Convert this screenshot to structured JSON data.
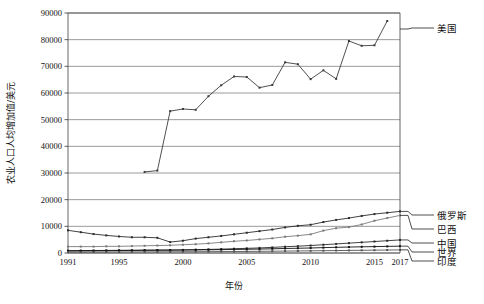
{
  "chart_data": {
    "type": "line",
    "title": "",
    "xlabel": "年份",
    "ylabel": "农业人口人均增加值/美元",
    "xlim": [
      1991,
      2017
    ],
    "ylim": [
      0,
      90000
    ],
    "ytick_labels": [
      "0",
      "10000",
      "20000",
      "30000",
      "40000",
      "50000",
      "60000",
      "70000",
      "80000",
      "90000"
    ],
    "ytick_values": [
      0,
      10000,
      20000,
      30000,
      40000,
      50000,
      60000,
      70000,
      80000,
      90000
    ],
    "xtick_labels": [
      "1991",
      "1995",
      "2000",
      "2005",
      "2010",
      "2015",
      "2017"
    ],
    "xtick_values": [
      1991,
      1995,
      2000,
      2005,
      2010,
      2015,
      2017
    ],
    "grid": true,
    "legend_position": "right",
    "x": [
      1991,
      1992,
      1993,
      1994,
      1995,
      1996,
      1997,
      1998,
      1999,
      2000,
      2001,
      2002,
      2003,
      2004,
      2005,
      2006,
      2007,
      2008,
      2009,
      2010,
      2011,
      2012,
      2013,
      2014,
      2015,
      2016
    ],
    "series": [
      {
        "name": "美国",
        "color": "#3c3c3c",
        "x": [
          1997,
          1998,
          1999,
          2000,
          2001,
          2002,
          2003,
          2004,
          2005,
          2006,
          2007,
          2008,
          2009,
          2010,
          2011,
          2012,
          2013,
          2014,
          2015,
          2016
        ],
        "values": [
          30400,
          30900,
          53200,
          54000,
          53700,
          58800,
          62900,
          66200,
          66000,
          62000,
          63000,
          71500,
          70800,
          65200,
          68500,
          65300,
          79500,
          77700,
          77900,
          87000
        ]
      },
      {
        "name": "俄罗斯",
        "color": "#2b2b2b",
        "x": [
          1991,
          1992,
          1993,
          1994,
          1995,
          1996,
          1997,
          1998,
          1999,
          2000,
          2001,
          2002,
          2003,
          2004,
          2005,
          2006,
          2007,
          2008,
          2009,
          2010,
          2011,
          2012,
          2013,
          2014,
          2015,
          2016,
          2017
        ],
        "values": [
          8500,
          7800,
          7100,
          6600,
          6200,
          5900,
          5900,
          5700,
          4100,
          4600,
          5400,
          5900,
          6400,
          7000,
          7600,
          8200,
          8800,
          9600,
          10200,
          10600,
          11600,
          12400,
          13100,
          13900,
          14600,
          15100,
          15600
        ]
      },
      {
        "name": "巴西",
        "color": "#7a7a7a",
        "x": [
          1991,
          1992,
          1993,
          1994,
          1995,
          1996,
          1997,
          1998,
          1999,
          2000,
          2001,
          2002,
          2003,
          2004,
          2005,
          2006,
          2007,
          2008,
          2009,
          2010,
          2011,
          2012,
          2013,
          2014,
          2015,
          2016,
          2017
        ],
        "values": [
          2400,
          2400,
          2400,
          2500,
          2500,
          2600,
          2700,
          2800,
          2900,
          3100,
          3300,
          3600,
          4000,
          4400,
          4700,
          5100,
          5500,
          6100,
          6500,
          7000,
          8400,
          9300,
          9700,
          10700,
          12100,
          13100,
          14100
        ]
      },
      {
        "name": "中国",
        "color": "#2b2b2b",
        "x": [
          1991,
          1992,
          1993,
          1994,
          1995,
          1996,
          1997,
          1998,
          1999,
          2000,
          2001,
          2002,
          2003,
          2004,
          2005,
          2006,
          2007,
          2008,
          2009,
          2010,
          2011,
          2012,
          2013,
          2014,
          2015,
          2016,
          2017
        ],
        "values": [
          700,
          750,
          800,
          850,
          900,
          950,
          1000,
          1050,
          1100,
          1150,
          1250,
          1350,
          1450,
          1600,
          1750,
          1900,
          2100,
          2350,
          2550,
          2800,
          3100,
          3400,
          3700,
          4000,
          4300,
          4600,
          4900
        ]
      },
      {
        "name": "世界",
        "color": "#111111",
        "x": [
          1991,
          1992,
          1993,
          1994,
          1995,
          1996,
          1997,
          1998,
          1999,
          2000,
          2001,
          2002,
          2003,
          2004,
          2005,
          2006,
          2007,
          2008,
          2009,
          2010,
          2011,
          2012,
          2013,
          2014,
          2015,
          2016,
          2017
        ],
        "values": [
          900,
          920,
          940,
          960,
          1000,
          1030,
          1060,
          1080,
          1100,
          1120,
          1160,
          1200,
          1260,
          1330,
          1400,
          1480,
          1580,
          1700,
          1780,
          1880,
          2020,
          2130,
          2230,
          2330,
          2400,
          2480,
          2560
        ]
      },
      {
        "name": "印度",
        "color": "#555555",
        "x": [
          1991,
          1992,
          1993,
          1994,
          1995,
          1996,
          1997,
          1998,
          1999,
          2000,
          2001,
          2002,
          2003,
          2004,
          2005,
          2006,
          2007,
          2008,
          2009,
          2010,
          2011,
          2012,
          2013,
          2014,
          2015,
          2016,
          2017
        ],
        "values": [
          330,
          340,
          350,
          370,
          390,
          410,
          420,
          440,
          455,
          465,
          480,
          500,
          530,
          560,
          590,
          630,
          680,
          720,
          760,
          810,
          870,
          920,
          970,
          1010,
          1060,
          1110,
          1170
        ]
      }
    ],
    "legend_entries": [
      {
        "label": "美国",
        "anchor_value": 84000
      },
      {
        "label": "俄罗斯",
        "anchor_value": 15600
      },
      {
        "label": "巴西",
        "anchor_value": 14100
      },
      {
        "label": "中国",
        "anchor_value": 4900
      },
      {
        "label": "世界",
        "anchor_value": 2560
      },
      {
        "label": "印度",
        "anchor_value": 1170
      }
    ]
  }
}
